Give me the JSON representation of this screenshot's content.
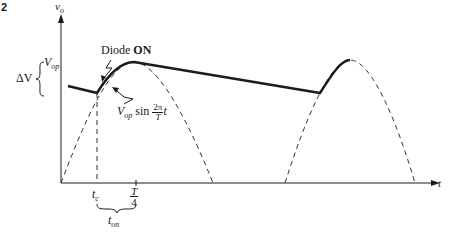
{
  "figure": {
    "number_label": "2",
    "y_axis_label": "v",
    "y_axis_label_sub": "o",
    "x_axis_label": "t",
    "delta_v_label": "ΔV",
    "vop_label": "V",
    "vop_label_sub": "op",
    "diode_on_prefix": "Diode ",
    "diode_on_bold": "ON",
    "sine_expr_v": "V",
    "sine_expr_sub": "op",
    "sine_expr_sin": " sin ",
    "sine_expr_num": "2π",
    "sine_expr_den": "T",
    "sine_expr_t": "t",
    "tc_label": "t",
    "tc_label_sub": "c",
    "t4_num": "T",
    "t4_den": "4",
    "ton_label": "t",
    "ton_label_sub": "on"
  },
  "colors": {
    "line": "#1a1a1a",
    "dashed": "#333333",
    "background": "#ffffff"
  }
}
